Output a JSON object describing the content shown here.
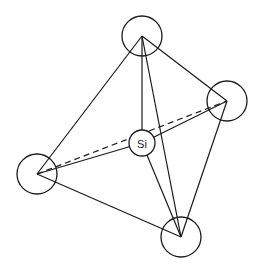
{
  "diagram": {
    "center_atom": {
      "label": "Si",
      "x": 142,
      "y": 143,
      "r": 13
    },
    "vertices": [
      {
        "id": "top",
        "x": 142,
        "y": 36,
        "r": 20
      },
      {
        "id": "right",
        "x": 227,
        "y": 101,
        "r": 20
      },
      {
        "id": "left",
        "x": 37,
        "y": 174,
        "r": 20
      },
      {
        "id": "bottom",
        "x": 181,
        "y": 237,
        "r": 20
      }
    ],
    "edges": [
      {
        "from": "top",
        "to": "left",
        "style": "solid"
      },
      {
        "from": "top",
        "to": "right",
        "style": "solid"
      },
      {
        "from": "top",
        "to": "bottom",
        "style": "solid"
      },
      {
        "from": "left",
        "to": "bottom",
        "style": "solid"
      },
      {
        "from": "right",
        "to": "bottom",
        "style": "solid"
      },
      {
        "from": "left",
        "to": "right",
        "style": "dashed"
      }
    ],
    "bonds": [
      "top",
      "right",
      "left",
      "bottom"
    ],
    "stroke_color": "#1a1a1a",
    "background": "#ffffff"
  }
}
